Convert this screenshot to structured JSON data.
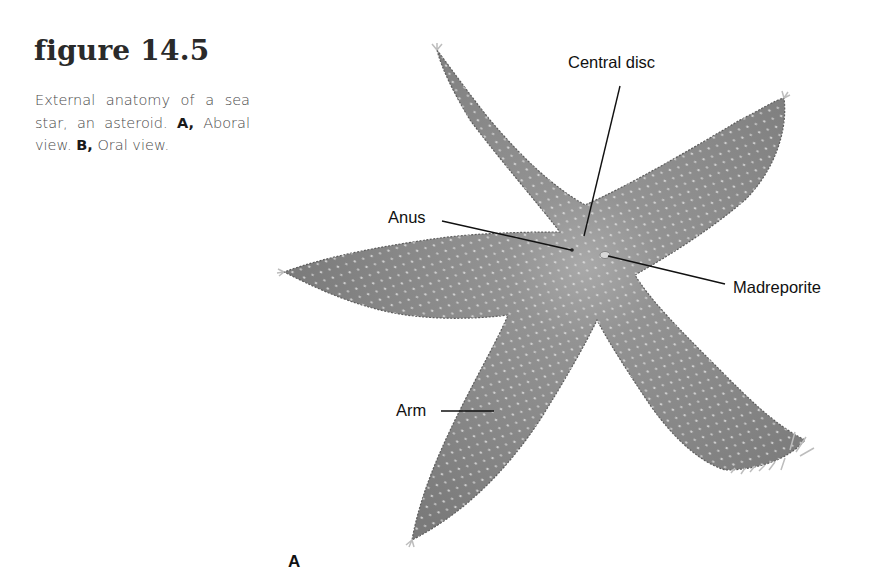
{
  "figure": {
    "heading": "figure 14.5",
    "caption": {
      "text_1": "External anatomy of a sea star, an asteroid.",
      "panel_a_key": "A,",
      "panel_a_desc": "Aboral view.",
      "panel_b_key": "B,",
      "panel_b_desc": "Oral view."
    }
  },
  "illustration": {
    "subject": "sea star (asteroid), aboral view",
    "labels": {
      "central_disc": "Central disc",
      "anus": "Anus",
      "madreporite": "Madreporite",
      "arm": "Arm"
    },
    "panel_label": "A",
    "colors": {
      "body": "#8a8a8a",
      "body_dark": "#6e6e6e",
      "body_light": "#a8a8a8",
      "leader_line": "#111111"
    }
  }
}
